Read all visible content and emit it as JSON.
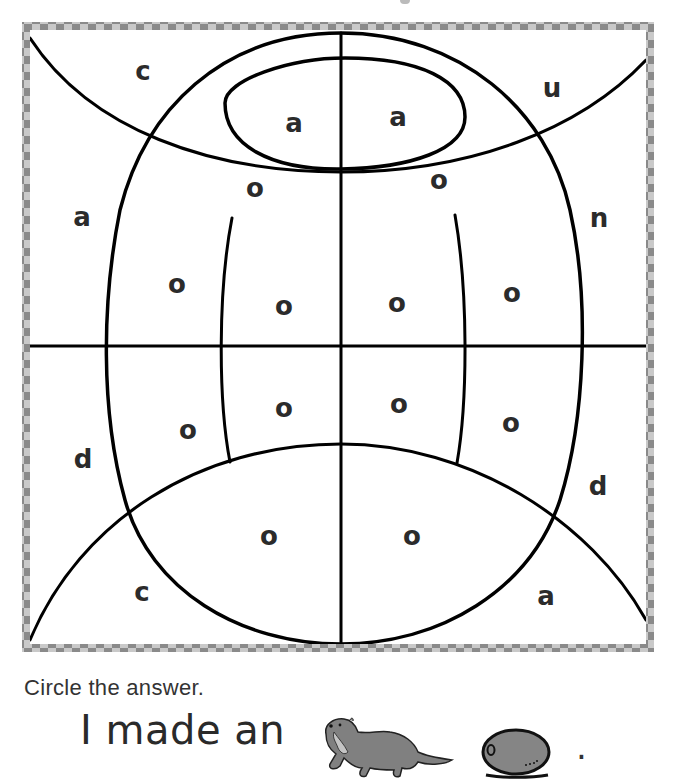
{
  "title_fragment": "",
  "puzzle": {
    "border_colors": {
      "dark": "#8a8a8a",
      "light": "#c9c9c9"
    },
    "line_color": "#000000",
    "regions": [
      {
        "id": "top-left-corner",
        "letter": "c",
        "x": 143,
        "y": 80
      },
      {
        "id": "inner-oval-left",
        "letter": "a",
        "x": 294,
        "y": 132
      },
      {
        "id": "inner-oval-right",
        "letter": "a",
        "x": 398,
        "y": 126
      },
      {
        "id": "top-right-corner",
        "letter": "u",
        "x": 552,
        "y": 97
      },
      {
        "id": "top-band-left",
        "letter": "o",
        "x": 255,
        "y": 197
      },
      {
        "id": "top-band-right",
        "letter": "o",
        "x": 439,
        "y": 189
      },
      {
        "id": "left-outer-upper",
        "letter": "a",
        "x": 82,
        "y": 226
      },
      {
        "id": "right-outer-upper",
        "letter": "n",
        "x": 599,
        "y": 227
      },
      {
        "id": "oval-left-upper",
        "letter": "o",
        "x": 177,
        "y": 293
      },
      {
        "id": "oval-midleft-upper",
        "letter": "o",
        "x": 284,
        "y": 315
      },
      {
        "id": "oval-midright-upper",
        "letter": "o",
        "x": 397,
        "y": 312
      },
      {
        "id": "oval-right-upper",
        "letter": "o",
        "x": 512,
        "y": 302
      },
      {
        "id": "oval-left-lower",
        "letter": "o",
        "x": 188,
        "y": 439
      },
      {
        "id": "oval-midleft-lower",
        "letter": "o",
        "x": 284,
        "y": 417
      },
      {
        "id": "oval-midright-lower",
        "letter": "o",
        "x": 399,
        "y": 413
      },
      {
        "id": "oval-right-lower",
        "letter": "o",
        "x": 511,
        "y": 432
      },
      {
        "id": "left-outer-lower",
        "letter": "d",
        "x": 83,
        "y": 468
      },
      {
        "id": "right-outer-lower",
        "letter": "d",
        "x": 598,
        "y": 495
      },
      {
        "id": "bottom-band-left",
        "letter": "o",
        "x": 269,
        "y": 545
      },
      {
        "id": "bottom-band-right",
        "letter": "o",
        "x": 412,
        "y": 545
      },
      {
        "id": "bottom-left-corner",
        "letter": "c",
        "x": 142,
        "y": 601
      },
      {
        "id": "bottom-right-corner",
        "letter": "a",
        "x": 546,
        "y": 605
      }
    ]
  },
  "instruction": "Circle the answer.",
  "sentence": {
    "prefix": "I made an",
    "suffix": ".",
    "choices": [
      {
        "id": "otter",
        "label": "otter",
        "color": "#808080"
      },
      {
        "id": "olive",
        "label": "olive",
        "color": "#858585"
      }
    ]
  }
}
